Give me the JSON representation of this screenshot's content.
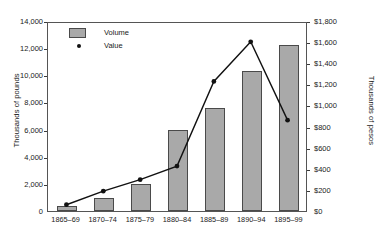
{
  "chart_data": {
    "type": "bar",
    "title": "",
    "subtitle": "",
    "xlabel": "",
    "categories": [
      "1865–69",
      "1870–74",
      "1875–79",
      "1880–84",
      "1885–89",
      "1890–94",
      "1895–99"
    ],
    "grid": false,
    "legend_position": "top-left",
    "series": [
      {
        "name": "Volume",
        "type": "bar",
        "axis": "left",
        "ylabel": "Thousands of pounds",
        "ylim": [
          0,
          14000
        ],
        "ytick_step": 2000,
        "color": "#a9a9a9",
        "values": [
          400,
          950,
          2000,
          5950,
          7600,
          10300,
          12250
        ]
      },
      {
        "name": "Value",
        "type": "line",
        "axis": "right",
        "ylabel": "Thousands of pesos",
        "ylim": [
          0,
          1800
        ],
        "ytick_step": 200,
        "color": "#111111",
        "values": [
          60,
          190,
          300,
          430,
          1240,
          1620,
          870
        ]
      }
    ],
    "left_axis": {
      "label": "Thousands of pounds",
      "ticks": [
        "0",
        "2,000",
        "4,000",
        "6,000",
        "8,000",
        "10,000",
        "12,000",
        "14,000"
      ],
      "tick_values": [
        0,
        2000,
        4000,
        6000,
        8000,
        10000,
        12000,
        14000
      ]
    },
    "right_axis": {
      "label": "Thousands of pesos",
      "ticks": [
        "$0",
        "$200",
        "$400",
        "$600",
        "$800",
        "$1,000",
        "$1,200",
        "$1,400",
        "$1,600",
        "$1,800"
      ],
      "tick_values": [
        0,
        200,
        400,
        600,
        800,
        1000,
        1200,
        1400,
        1600,
        1800
      ]
    },
    "legend": [
      {
        "label": "Volume",
        "marker": "bar-swatch",
        "color": "#a9a9a9"
      },
      {
        "label": "Value",
        "marker": "dot",
        "color": "#111111"
      }
    ]
  }
}
